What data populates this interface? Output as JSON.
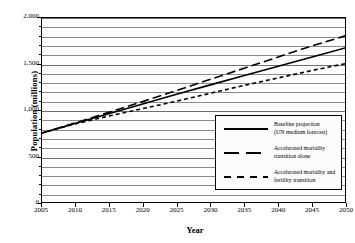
{
  "chart_data": {
    "type": "line",
    "title": "",
    "xlabel": "Year",
    "ylabel": "Population (millions)",
    "xlim": [
      2005,
      2050
    ],
    "ylim": [
      0,
      2000
    ],
    "grid": true,
    "grid_interval": 100,
    "ytick_interval": 500,
    "xtick_interval": 5,
    "legend_position": "bottom-right",
    "xticks": [
      "2005",
      "2010",
      "2015",
      "2020",
      "2025",
      "2030",
      "2035",
      "2040",
      "2045",
      "2050"
    ],
    "xtick_values": [
      2005,
      2010,
      2015,
      2020,
      2025,
      2030,
      2035,
      2040,
      2045,
      2050
    ],
    "yticks": [
      "0",
      "500",
      "1,000",
      "1,500",
      "2,000"
    ],
    "ytick_values": [
      0,
      500,
      1000,
      1500,
      2000
    ],
    "x": [
      2005,
      2010,
      2015,
      2020,
      2025,
      2030,
      2035,
      2040,
      2045,
      2050
    ],
    "series": [
      {
        "name": "Baseline projection (UN medium forecast)",
        "style": "solid",
        "color": "#000000",
        "values": [
          750,
          855,
          960,
          1065,
          1170,
          1270,
          1370,
          1470,
          1570,
          1670
        ]
      },
      {
        "name": "Accelerated mortality transition alone",
        "style": "long-dash",
        "color": "#000000",
        "values": [
          750,
          860,
          975,
          1090,
          1210,
          1330,
          1450,
          1570,
          1690,
          1800
        ]
      },
      {
        "name": "Accelerated mortality and fertility transition",
        "style": "short-dash",
        "color": "#000000",
        "values": [
          750,
          850,
          935,
          1015,
          1095,
          1180,
          1265,
          1345,
          1425,
          1500
        ]
      }
    ],
    "legend": [
      {
        "line1": "Baseline projection",
        "line2": "(UN medium forecast)",
        "style": "solid"
      },
      {
        "line1": "Accelerated mortality",
        "line2": "transition alone",
        "style": "long-dash"
      },
      {
        "line1": "Accelerated mortality and",
        "line2": "fertility transition",
        "style": "short-dash"
      }
    ]
  }
}
